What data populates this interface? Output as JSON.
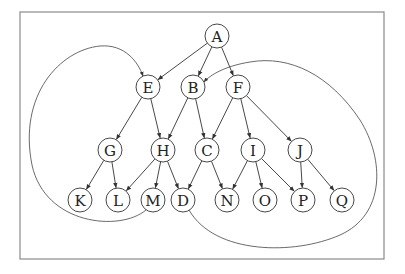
{
  "diagram": {
    "type": "directed-graph",
    "frame": {
      "x": 20,
      "y": 12,
      "w": 364,
      "h": 247
    },
    "node_radius": 12,
    "nodes": [
      {
        "id": "A",
        "label": "A",
        "x": 217,
        "y": 36
      },
      {
        "id": "E",
        "label": "E",
        "x": 148,
        "y": 87
      },
      {
        "id": "B",
        "label": "B",
        "x": 193,
        "y": 87
      },
      {
        "id": "F",
        "label": "F",
        "x": 238,
        "y": 87
      },
      {
        "id": "G",
        "label": "G",
        "x": 110,
        "y": 150
      },
      {
        "id": "H",
        "label": "H",
        "x": 163,
        "y": 150
      },
      {
        "id": "C",
        "label": "C",
        "x": 207,
        "y": 150
      },
      {
        "id": "I",
        "label": "I",
        "x": 253,
        "y": 150
      },
      {
        "id": "J",
        "label": "J",
        "x": 300,
        "y": 150
      },
      {
        "id": "K",
        "label": "K",
        "x": 80,
        "y": 200
      },
      {
        "id": "L",
        "label": "L",
        "x": 118,
        "y": 200
      },
      {
        "id": "M",
        "label": "M",
        "x": 153,
        "y": 200
      },
      {
        "id": "D",
        "label": "D",
        "x": 183,
        "y": 200
      },
      {
        "id": "N",
        "label": "N",
        "x": 227,
        "y": 200
      },
      {
        "id": "O",
        "label": "O",
        "x": 265,
        "y": 200
      },
      {
        "id": "P",
        "label": "P",
        "x": 303,
        "y": 200
      },
      {
        "id": "Q",
        "label": "Q",
        "x": 342,
        "y": 200
      }
    ],
    "edges": [
      {
        "from": "A",
        "to": "E"
      },
      {
        "from": "A",
        "to": "B"
      },
      {
        "from": "A",
        "to": "F"
      },
      {
        "from": "E",
        "to": "G"
      },
      {
        "from": "E",
        "to": "H"
      },
      {
        "from": "B",
        "to": "H"
      },
      {
        "from": "B",
        "to": "C"
      },
      {
        "from": "F",
        "to": "C"
      },
      {
        "from": "F",
        "to": "I"
      },
      {
        "from": "F",
        "to": "J"
      },
      {
        "from": "G",
        "to": "K"
      },
      {
        "from": "G",
        "to": "L"
      },
      {
        "from": "H",
        "to": "L"
      },
      {
        "from": "H",
        "to": "M"
      },
      {
        "from": "H",
        "to": "D"
      },
      {
        "from": "C",
        "to": "D"
      },
      {
        "from": "C",
        "to": "N"
      },
      {
        "from": "I",
        "to": "N"
      },
      {
        "from": "I",
        "to": "O"
      },
      {
        "from": "I",
        "to": "P"
      },
      {
        "from": "J",
        "to": "P"
      },
      {
        "from": "J",
        "to": "Q"
      }
    ],
    "curved_edges": [
      {
        "from": "M",
        "to": "E",
        "path": "M 146 210 C 120 232, 45 225, 32 165 C 18 95, 60 50, 100 46 C 125 44, 138 62, 143 76"
      },
      {
        "from": "D",
        "to": "B",
        "path": "M 189 210 C 215 255, 295 255, 340 235 C 385 215, 385 160, 360 120 C 330 75, 290 55, 250 62 C 225 66, 210 75, 204 82"
      }
    ]
  }
}
